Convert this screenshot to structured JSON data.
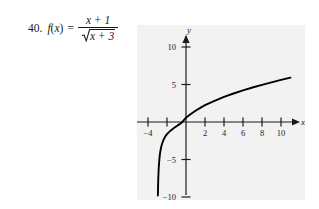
{
  "problem": {
    "number": "40.",
    "function_name": "f",
    "variable": "x",
    "open_paren": "(",
    "close_paren": ")",
    "equals": "=",
    "numerator": "x + 1",
    "denominator_radicand": "x + 3",
    "radical_symbol": "radical-sign",
    "full_expression": "f(x) = (x + 1) / √(x + 3)"
  },
  "chart_data": {
    "type": "line",
    "title": "",
    "xlabel": "x",
    "ylabel": "y",
    "xlim": [
      -4.8,
      11.6
    ],
    "ylim": [
      -12.5,
      12.0
    ],
    "grid": false,
    "legend": null,
    "x_ticks": [
      -4,
      2,
      4,
      6,
      8,
      10
    ],
    "x_tick_labels": [
      "−4",
      "2",
      "4",
      "6",
      "8",
      "10"
    ],
    "x_ticks_unlabeled": [
      -2
    ],
    "y_ticks": [
      10,
      5,
      -5,
      -10
    ],
    "y_tick_labels": [
      "10",
      "5",
      "−5",
      "−10"
    ],
    "vertical_asymptote": -3,
    "x_intercept": -1,
    "series": [
      {
        "name": "f(x) = (x + 1)/sqrt(x + 3)",
        "x": [
          -2.96,
          -2.94,
          -2.92,
          -2.9,
          -2.87,
          -2.84,
          -2.8,
          -2.75,
          -2.7,
          -2.6,
          -2.5,
          -2.4,
          -2.25,
          -2.1,
          -2.0,
          -1.8,
          -1.6,
          -1.4,
          -1.2,
          -1.0,
          -0.75,
          -0.5,
          0.0,
          0.5,
          1.0,
          1.5,
          2.0,
          3.0,
          4.0,
          5.0,
          6.0,
          7.0,
          8.0,
          9.0,
          10.0,
          11.0
        ],
        "y": [
          -9.8,
          -8.65,
          -7.57,
          -6.96,
          -6.13,
          -5.56,
          -4.92,
          -4.33,
          -3.89,
          -3.26,
          -2.83,
          -2.49,
          -2.08,
          -1.78,
          -1.63,
          -1.35,
          -1.12,
          -0.93,
          -0.74,
          -0.57,
          -0.35,
          -0.14,
          0.58,
          1.07,
          1.5,
          1.89,
          2.24,
          2.83,
          3.35,
          3.8,
          4.22,
          4.6,
          4.95,
          5.29,
          5.61,
          5.91
        ],
        "color": "#000000"
      }
    ],
    "axis_color": "#1a1a1a",
    "panel_color": "#f2f2f2",
    "arrow_heads": [
      "x-positive",
      "y-positive"
    ]
  }
}
